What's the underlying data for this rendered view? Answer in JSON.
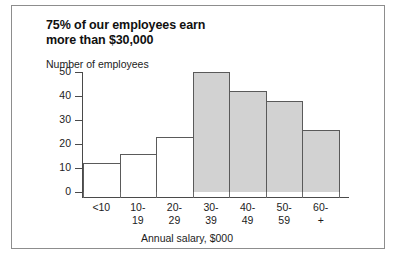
{
  "figure": {
    "title_lines": [
      "75% of our employees earn",
      "more than $30,000"
    ],
    "border_color": "#8d8d8d"
  },
  "chart_data": {
    "type": "bar",
    "title": "75% of our employees earn more than $30,000",
    "xlabel": "Annual salary, $000",
    "ylabel": "Number of employees",
    "categories": [
      "<10",
      "10-19",
      "20-29",
      "30-39",
      "40-49",
      "50-59",
      "60-+"
    ],
    "category_lines": [
      [
        "<10",
        ""
      ],
      [
        "10-",
        "19"
      ],
      [
        "20-",
        "29"
      ],
      [
        "30-",
        "39"
      ],
      [
        "40-",
        "49"
      ],
      [
        "50-",
        "59"
      ],
      [
        "60-",
        "+"
      ]
    ],
    "values": [
      12,
      16,
      23,
      50,
      42,
      38,
      26
    ],
    "bar_styles": [
      "white",
      "white",
      "white",
      "shaded",
      "shaded",
      "shaded",
      "shaded"
    ],
    "ylim": [
      0,
      50
    ],
    "yticks": [
      0,
      10,
      20,
      30,
      40,
      50
    ],
    "ytick_labels": [
      "0",
      "10",
      "20",
      "30",
      "40",
      "50"
    ],
    "grid": false,
    "legend": "none",
    "colors": {
      "bar_fill_shaded": "#d2d2d2",
      "bar_fill_plain": "#ffffff",
      "bar_edge": "#5a5a5a",
      "axis": "#4a4a4a",
      "text": "#1c1c1c"
    }
  }
}
